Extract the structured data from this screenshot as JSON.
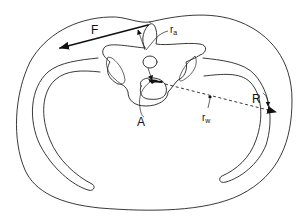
{
  "figure": {
    "type": "anatomical cross-section diagram",
    "labels": {
      "force": "F",
      "moment_arm_muscle": "r",
      "moment_arm_muscle_sub": "a",
      "axis_point": "A",
      "moment_arm_weight": "r",
      "moment_arm_weight_sub": "w",
      "resultant": "R"
    },
    "colors": {
      "line": "#222222",
      "background": "#ffffff"
    }
  }
}
